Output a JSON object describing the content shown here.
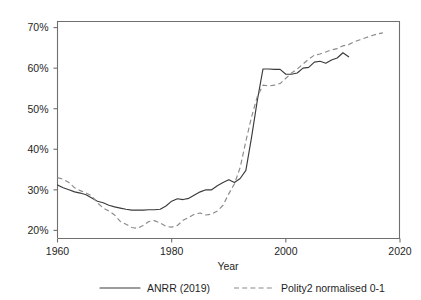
{
  "chart_data": {
    "type": "line",
    "title": "",
    "xlabel": "Year",
    "ylabel": "",
    "xlim": [
      1960,
      2020
    ],
    "ylim": [
      0.18,
      0.715
    ],
    "grid": false,
    "legend_position": "bottom",
    "x_ticks": [
      "1960",
      "1980",
      "2000",
      "2020"
    ],
    "x_tick_values": [
      1960,
      1980,
      2000,
      2020
    ],
    "y_ticks": [
      "20%",
      "30%",
      "40%",
      "50%",
      "60%",
      "70%"
    ],
    "y_tick_values": [
      0.2,
      0.3,
      0.4,
      0.5,
      0.6,
      0.7
    ],
    "series": [
      {
        "name": "ANRR (2019)",
        "style": "solid",
        "color": "#3b3b3b",
        "x": [
          1960,
          1961,
          1962,
          1963,
          1964,
          1965,
          1966,
          1967,
          1968,
          1969,
          1970,
          1971,
          1972,
          1973,
          1974,
          1975,
          1976,
          1977,
          1978,
          1979,
          1980,
          1981,
          1982,
          1983,
          1984,
          1985,
          1986,
          1987,
          1988,
          1989,
          1990,
          1991,
          1992,
          1993,
          1994,
          1995,
          1996,
          1997,
          1998,
          1999,
          2000,
          2001,
          2002,
          2003,
          2004,
          2005,
          2006,
          2007,
          2008,
          2009,
          2010,
          2011
        ],
        "values": [
          0.312,
          0.305,
          0.3,
          0.295,
          0.292,
          0.288,
          0.28,
          0.272,
          0.268,
          0.262,
          0.258,
          0.255,
          0.252,
          0.25,
          0.25,
          0.25,
          0.251,
          0.251,
          0.252,
          0.26,
          0.272,
          0.278,
          0.276,
          0.279,
          0.287,
          0.295,
          0.3,
          0.3,
          0.31,
          0.318,
          0.325,
          0.318,
          0.328,
          0.348,
          0.43,
          0.52,
          0.598,
          0.598,
          0.597,
          0.597,
          0.585,
          0.585,
          0.588,
          0.6,
          0.602,
          0.615,
          0.617,
          0.612,
          0.62,
          0.625,
          0.638,
          0.628
        ]
      },
      {
        "name": "Polity2 normalised 0-1",
        "style": "dashed",
        "color": "#8a8a8a",
        "x": [
          1960,
          1961,
          1962,
          1963,
          1964,
          1965,
          1966,
          1967,
          1968,
          1969,
          1970,
          1971,
          1972,
          1973,
          1974,
          1975,
          1976,
          1977,
          1978,
          1979,
          1980,
          1981,
          1982,
          1983,
          1984,
          1985,
          1986,
          1987,
          1988,
          1989,
          1990,
          1991,
          1992,
          1993,
          1994,
          1995,
          1996,
          1997,
          1998,
          1999,
          2000,
          2001,
          2002,
          2003,
          2004,
          2005,
          2006,
          2007,
          2008,
          2009,
          2010,
          2011,
          2012,
          2013,
          2014,
          2015,
          2016,
          2017
        ],
        "values": [
          0.33,
          0.326,
          0.318,
          0.305,
          0.298,
          0.292,
          0.285,
          0.268,
          0.255,
          0.248,
          0.238,
          0.222,
          0.215,
          0.207,
          0.205,
          0.212,
          0.222,
          0.224,
          0.218,
          0.21,
          0.208,
          0.212,
          0.225,
          0.232,
          0.24,
          0.243,
          0.238,
          0.24,
          0.248,
          0.262,
          0.29,
          0.315,
          0.355,
          0.42,
          0.48,
          0.53,
          0.558,
          0.556,
          0.558,
          0.562,
          0.575,
          0.588,
          0.598,
          0.61,
          0.622,
          0.632,
          0.635,
          0.64,
          0.645,
          0.648,
          0.655,
          0.658,
          0.665,
          0.67,
          0.675,
          0.68,
          0.684,
          0.687
        ]
      }
    ]
  },
  "legend": {
    "entries": [
      {
        "label": "ANRR (2019)",
        "style": "solid"
      },
      {
        "label": "Polity2 normalised 0-1",
        "style": "dashed"
      }
    ]
  }
}
